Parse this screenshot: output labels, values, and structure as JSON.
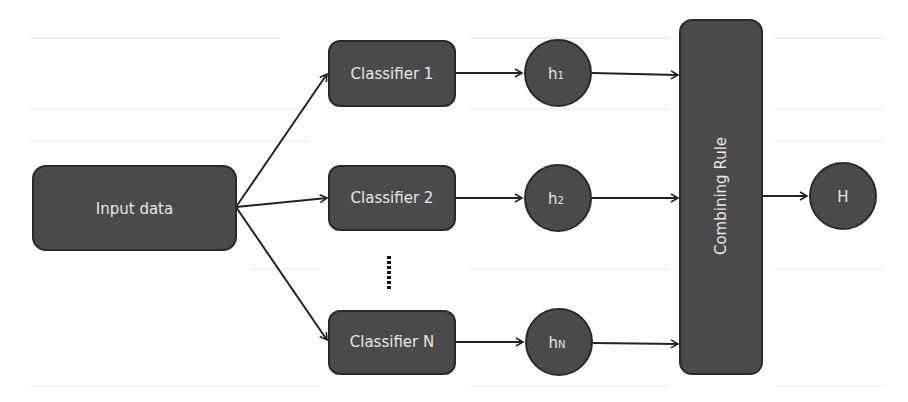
{
  "diagram": {
    "type": "ensemble-classifier-flow",
    "colors": {
      "node_fill": "#4a4a4a",
      "node_stroke": "#2a2a2a",
      "label_text": "#e6e6e6",
      "arrow": "#222222",
      "background": "#ffffff"
    },
    "input": {
      "label": "Input data"
    },
    "classifiers": [
      {
        "label": "Classifier 1"
      },
      {
        "label": "Classifier 2"
      },
      {
        "label": "Classifier N"
      }
    ],
    "ellipsis": "⋮",
    "hypotheses": [
      {
        "base": "h",
        "subscript": "1"
      },
      {
        "base": "h",
        "subscript": "2"
      },
      {
        "base": "h",
        "subscript": "N"
      }
    ],
    "combiner": {
      "label": "Combining Rule"
    },
    "output": {
      "label": "H"
    },
    "edges": [
      {
        "from": "Input data",
        "to": "Classifier 1"
      },
      {
        "from": "Input data",
        "to": "Classifier 2"
      },
      {
        "from": "Input data",
        "to": "Classifier N"
      },
      {
        "from": "Classifier 1",
        "to": "h1"
      },
      {
        "from": "Classifier 2",
        "to": "h2"
      },
      {
        "from": "Classifier N",
        "to": "hN"
      },
      {
        "from": "h1",
        "to": "Combining Rule"
      },
      {
        "from": "h2",
        "to": "Combining Rule"
      },
      {
        "from": "hN",
        "to": "Combining Rule"
      },
      {
        "from": "Combining Rule",
        "to": "H"
      }
    ]
  }
}
